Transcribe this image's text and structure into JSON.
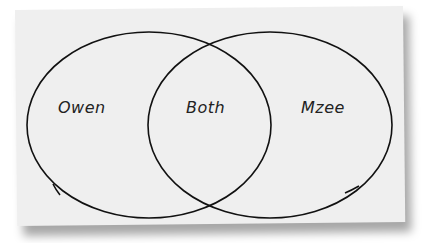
{
  "diagram": {
    "type": "venn",
    "sets": [
      {
        "id": "left",
        "label": "Owen"
      },
      {
        "id": "overlap",
        "label": "Both"
      },
      {
        "id": "right",
        "label": "Mzee"
      }
    ]
  },
  "colors": {
    "paper": "#efefef",
    "stroke": "#111111",
    "text": "#222222"
  }
}
